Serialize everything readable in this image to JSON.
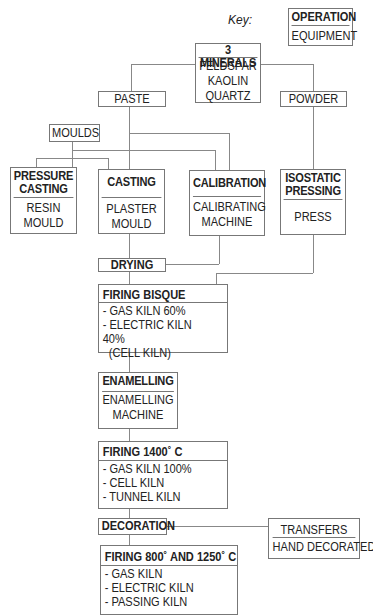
{
  "key": {
    "label": "Key:",
    "operation": "OPERATION",
    "equipment": "EQUIPMENT"
  },
  "minerals": {
    "title": "3 MINERALS",
    "items": [
      "FELDSPAR",
      "KAOLIN",
      "QUARTZ"
    ]
  },
  "paste": "PASTE",
  "powder": "POWDER",
  "moulds": "MOULDS",
  "pressure_casting": {
    "title_line1": "PRESSURE",
    "title_line2": "CASTING",
    "equip_line1": "RESIN",
    "equip_line2": "MOULD"
  },
  "casting": {
    "title": "CASTING",
    "equip_line1": "PLASTER",
    "equip_line2": "MOULD"
  },
  "calibration": {
    "title": "CALIBRATION",
    "equip_line1": "CALIBRATING",
    "equip_line2": "MACHINE"
  },
  "isostatic": {
    "title_line1": "ISOSTATIC",
    "title_line2": "PRESSING",
    "equip": "PRESS"
  },
  "drying": "DRYING",
  "firing_bisque": {
    "title": "FIRING BISQUE",
    "items": [
      "- GAS KILN 60%",
      "- ELECTRIC KILN 40%",
      "  (CELL KILN)"
    ]
  },
  "enamelling": {
    "title": "ENAMELLING",
    "equip_line1": "ENAMELLING",
    "equip_line2": "MACHINE"
  },
  "firing_1400": {
    "title": "FIRING 1400˚ C",
    "items": [
      "- GAS KILN 100%",
      "- CELL KILN",
      "- TUNNEL KILN"
    ]
  },
  "decoration": "DECORATION",
  "decoration_methods": {
    "line1": "TRANSFERS",
    "line2": "HAND DECORATED"
  },
  "firing_800": {
    "title": "FIRING 800˚ AND 1250˚ C",
    "items": [
      "- GAS KILN",
      "- ELECTRIC KILN",
      "- PASSING KILN"
    ]
  }
}
